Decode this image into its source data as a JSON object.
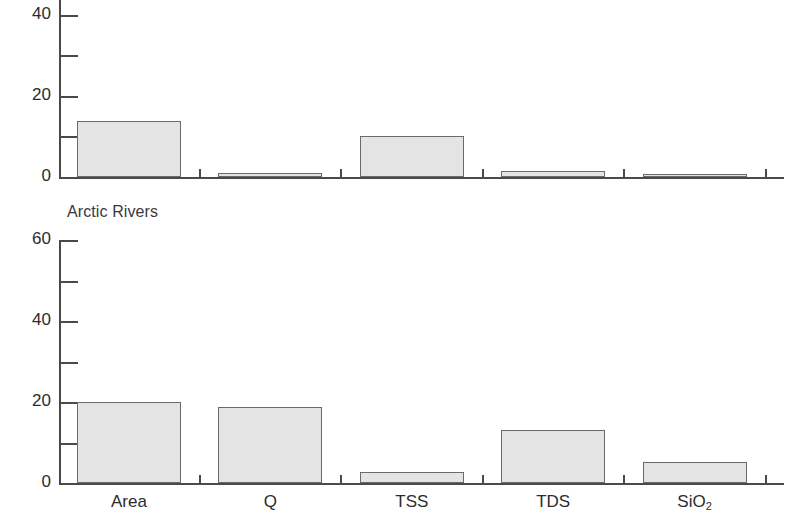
{
  "figure": {
    "background_color": "#ffffff",
    "bar_fill_color": "#e4e4e4",
    "bar_edge_color": "#6a6a6a",
    "axis_color": "#4a4a4a",
    "text_color": "#2c2c2c"
  },
  "chart_data": [
    {
      "type": "bar",
      "panel_index": 0,
      "title": "",
      "xlabel": "",
      "ylabel": "",
      "categories": [
        "Area",
        "Q",
        "TSS",
        "TDS",
        "SiO2"
      ],
      "category_labels_html": [
        "Area",
        "Q",
        "TSS",
        "TDS",
        "SiO<sub>2</sub>"
      ],
      "values": [
        13.7,
        1.0,
        10.0,
        1.5,
        0.5
      ],
      "ylim": [
        0,
        44
      ],
      "y_axis_clipped_top": true,
      "major_ticks": [
        0,
        20,
        40
      ],
      "minor_ticks": [
        10,
        30
      ],
      "tick_labels": [
        "0",
        "20",
        "40"
      ],
      "grid": false,
      "legend": "none",
      "x_tick_labels_visible": false
    },
    {
      "type": "bar",
      "panel_index": 1,
      "title": "Arctic Rivers",
      "xlabel": "",
      "ylabel": "",
      "categories": [
        "Area",
        "Q",
        "TSS",
        "TDS",
        "SiO2"
      ],
      "category_labels_html": [
        "Area",
        "Q",
        "TSS",
        "TDS",
        "SiO<sub>2</sub>"
      ],
      "values": [
        20.0,
        18.7,
        2.8,
        13.0,
        5.2
      ],
      "ylim": [
        0,
        60
      ],
      "y_axis_clipped_top": false,
      "major_ticks": [
        0,
        20,
        40,
        60
      ],
      "minor_ticks": [
        10,
        30,
        50
      ],
      "tick_labels": [
        "0",
        "20",
        "40",
        "60"
      ],
      "grid": false,
      "legend": "none",
      "x_tick_labels_visible": true
    }
  ],
  "panels": [
    {
      "name": "upper-panel",
      "title": "",
      "y_tick_labels": [
        "40",
        "20",
        "0"
      ],
      "x_tick_labels": []
    },
    {
      "name": "lower-panel",
      "title": "Arctic Rivers",
      "y_tick_labels": [
        "60",
        "40",
        "20",
        "0"
      ],
      "x_tick_labels": [
        "Area",
        "Q",
        "TSS",
        "TDS",
        "SiO2"
      ]
    }
  ]
}
